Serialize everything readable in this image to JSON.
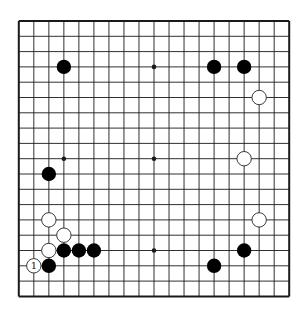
{
  "game": {
    "type": "go",
    "board_size": 19,
    "colors": {
      "board": "#ffffff",
      "line": "#1a1a1a",
      "black_stone": "#000000",
      "white_stone": "#ffffff",
      "white_stroke": "#222222",
      "label": "#111111"
    },
    "star_points": [
      {
        "col": 3,
        "row": 3
      },
      {
        "col": 9,
        "row": 3
      },
      {
        "col": 15,
        "row": 3
      },
      {
        "col": 3,
        "row": 9
      },
      {
        "col": 9,
        "row": 9
      },
      {
        "col": 15,
        "row": 9
      },
      {
        "col": 3,
        "row": 15
      },
      {
        "col": 9,
        "row": 15
      },
      {
        "col": 15,
        "row": 15
      }
    ],
    "stones": [
      {
        "color": "black",
        "col": 3,
        "row": 3
      },
      {
        "color": "black",
        "col": 13,
        "row": 3
      },
      {
        "color": "black",
        "col": 15,
        "row": 3
      },
      {
        "color": "white",
        "col": 16,
        "row": 5
      },
      {
        "color": "white",
        "col": 15,
        "row": 9
      },
      {
        "color": "black",
        "col": 2,
        "row": 10
      },
      {
        "color": "white",
        "col": 2,
        "row": 13
      },
      {
        "color": "white",
        "col": 16,
        "row": 13
      },
      {
        "color": "white",
        "col": 3,
        "row": 14
      },
      {
        "color": "white",
        "col": 2,
        "row": 15
      },
      {
        "color": "black",
        "col": 3,
        "row": 15
      },
      {
        "color": "black",
        "col": 4,
        "row": 15
      },
      {
        "color": "black",
        "col": 5,
        "row": 15
      },
      {
        "color": "black",
        "col": 15,
        "row": 15
      },
      {
        "color": "white",
        "col": 1,
        "row": 16,
        "label": "1"
      },
      {
        "color": "black",
        "col": 2,
        "row": 16
      },
      {
        "color": "black",
        "col": 13,
        "row": 16
      }
    ]
  }
}
